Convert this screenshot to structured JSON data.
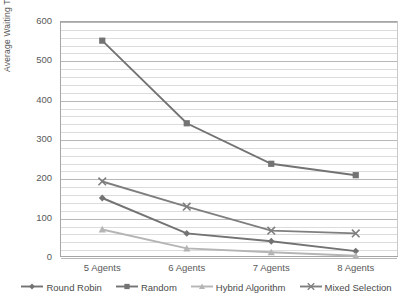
{
  "chart_data": {
    "type": "line",
    "title": "",
    "subtitle": "",
    "xlabel": "",
    "ylabel": "Average Waiting Time",
    "categories": [
      "5 Agents",
      "6  Agents",
      "7 Agents",
      "8 Agents"
    ],
    "ylim": [
      0,
      600
    ],
    "yticks": [
      0,
      100,
      200,
      300,
      400,
      500,
      600
    ],
    "ytick_labels": [
      "0",
      "100",
      "200",
      "300",
      "400",
      "500",
      "600"
    ],
    "minor_gridlines_per_interval": 4,
    "grid": true,
    "legend_position": "bottom",
    "series": [
      {
        "name": "Round Robin",
        "marker": "diamond",
        "color": "#737373",
        "values": [
          150,
          60,
          40,
          15
        ]
      },
      {
        "name": "Random",
        "marker": "square",
        "color": "#737373",
        "values": [
          550,
          340,
          237,
          208
        ]
      },
      {
        "name": "Hybrid Algorithm",
        "marker": "triangle",
        "color": "#b5b5b5",
        "values": [
          70,
          22,
          12,
          3
        ]
      },
      {
        "name": "Mixed Selection",
        "marker": "x",
        "color": "#7f7f7f",
        "values": [
          192,
          128,
          67,
          60
        ]
      }
    ]
  },
  "axis": {
    "y_title": "Average Waiting Time"
  },
  "colors": {
    "plot_border": "#a6a6a6",
    "gridline_minor": "#dcdcdc",
    "gridline_major": "#b8b8b8",
    "text": "#595959",
    "background": "#ffffff"
  }
}
